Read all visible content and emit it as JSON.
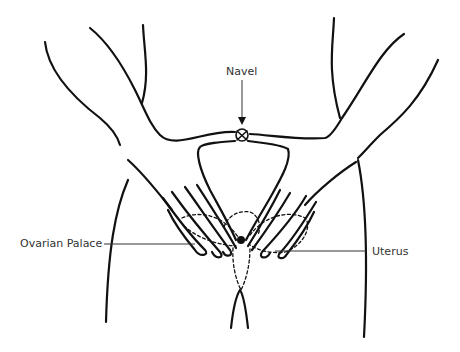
{
  "figure": {
    "type": "anatomical line drawing",
    "line_color": "#111111",
    "background": "#ffffff"
  },
  "labels": {
    "navel": "Navel",
    "ovarian_palace": "Ovarian Palace",
    "uterus": "Uterus"
  }
}
